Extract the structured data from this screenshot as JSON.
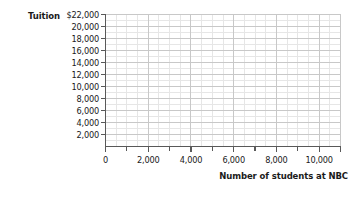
{
  "chart_data": {
    "type": "scatter",
    "title": "",
    "subtitle": "",
    "xlabel": "Number of students at NBC",
    "ylabel": "Tuition",
    "grid": true,
    "legend": false,
    "legend_position": "none",
    "series": [],
    "x": [],
    "values": [],
    "annotations": [],
    "note": "Empty plotting grid; no data series are drawn.",
    "xlim": [
      0,
      11000
    ],
    "ylim": [
      0,
      22000
    ],
    "x_major_step": 2000,
    "x_minor_step": 500,
    "y_major_step": 2000,
    "y_minor_step": 1000,
    "x_tick_labels": [
      "0",
      "2,000",
      "4,000",
      "6,000",
      "8,000",
      "10,000"
    ],
    "x_tick_values": [
      0,
      2000,
      4000,
      6000,
      8000,
      10000
    ],
    "y_tick_labels": [
      "$22,000",
      "20,000",
      "18,000",
      "16,000",
      "14,000",
      "12,000",
      "10,000",
      "8,000",
      "6,000",
      "4,000",
      "2,000"
    ],
    "y_tick_values": [
      22000,
      20000,
      18000,
      16000,
      14000,
      12000,
      10000,
      8000,
      6000,
      4000,
      2000
    ],
    "colors": {
      "background": "#ffffff",
      "axis": "#595959",
      "major_gridline": "#c8c8c8",
      "minor_gridline": "#e6e6e6",
      "text": "#1a1a1a"
    }
  },
  "axes": {
    "y_title": "Tuition",
    "x_title": "Number of students at NBC"
  }
}
